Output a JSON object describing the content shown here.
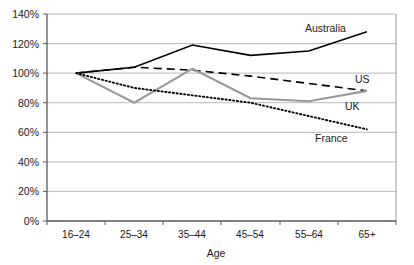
{
  "chart_data": {
    "type": "line",
    "title": "",
    "xlabel": "Age",
    "ylabel": "",
    "categories": [
      "16–24",
      "25–34",
      "35–44",
      "45–54",
      "55–64",
      "65+"
    ],
    "ylim": [
      0,
      140
    ],
    "ytick_labels": [
      "0%",
      "20%",
      "40%",
      "60%",
      "80%",
      "100%",
      "120%",
      "140%"
    ],
    "ytick_values": [
      0,
      20,
      40,
      60,
      80,
      100,
      120,
      140
    ],
    "grid": "horizontal",
    "legend_position": "inline-right-of-series",
    "series": [
      {
        "name": "Australia",
        "style": "solid",
        "color": "#000000",
        "values": [
          100,
          104,
          119,
          112,
          115,
          128
        ]
      },
      {
        "name": "US",
        "style": "dashed",
        "color": "#000000",
        "values": [
          100,
          104,
          102,
          98,
          93,
          88
        ]
      },
      {
        "name": "UK",
        "style": "solid",
        "color": "#999999",
        "values": [
          100,
          80,
          103,
          83,
          81,
          88
        ]
      },
      {
        "name": "France",
        "style": "dotted",
        "color": "#000000",
        "values": [
          100,
          90,
          85,
          80,
          71,
          62
        ]
      }
    ],
    "annotations": [
      {
        "text": "Australia",
        "series": "Australia"
      },
      {
        "text": "US",
        "series": "US"
      },
      {
        "text": "UK",
        "series": "UK"
      },
      {
        "text": "France",
        "series": "France"
      }
    ]
  }
}
